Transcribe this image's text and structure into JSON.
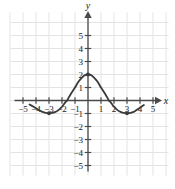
{
  "chart_data": {
    "type": "line",
    "title": "",
    "xlabel": "x",
    "ylabel": "y",
    "xlim": [
      -5.8,
      5.8
    ],
    "ylim": [
      -5.8,
      5.8
    ],
    "grid": true,
    "legend": null,
    "x_ticks": [
      -5,
      -4,
      -3,
      -2,
      -1,
      1,
      2,
      3,
      4,
      5
    ],
    "y_ticks": [
      -5,
      -4,
      -3,
      -2,
      -1,
      1,
      2,
      3,
      4,
      5
    ],
    "x_tick_labels": [
      "-5",
      "-4",
      "-3",
      "-2",
      "-1",
      "1",
      "2",
      "3",
      "4",
      "5"
    ],
    "y_tick_labels": [
      "-5",
      "-4",
      "-3",
      "-2",
      "-1",
      "1",
      "2",
      "3",
      "4",
      "5"
    ],
    "series": [
      {
        "name": "curve",
        "color": "#3a3a3a",
        "points": [
          [
            -4.5,
            -0.3
          ],
          [
            -4.25,
            -0.45
          ],
          [
            -4.0,
            -0.6
          ],
          [
            -3.75,
            -0.75
          ],
          [
            -3.5,
            -0.88
          ],
          [
            -3.25,
            -0.95
          ],
          [
            -3.0,
            -0.98
          ],
          [
            -2.75,
            -0.95
          ],
          [
            -2.5,
            -0.88
          ],
          [
            -2.25,
            -0.72
          ],
          [
            -2.0,
            -0.48
          ],
          [
            -1.75,
            -0.15
          ],
          [
            -1.6,
            0.0
          ],
          [
            -1.5,
            0.2
          ],
          [
            -1.25,
            0.62
          ],
          [
            -1.0,
            1.0
          ],
          [
            -0.75,
            1.42
          ],
          [
            -0.5,
            1.72
          ],
          [
            -0.25,
            1.94
          ],
          [
            0.0,
            2.0
          ],
          [
            0.25,
            1.94
          ],
          [
            0.5,
            1.72
          ],
          [
            0.75,
            1.42
          ],
          [
            1.0,
            1.0
          ],
          [
            1.25,
            0.62
          ],
          [
            1.5,
            0.2
          ],
          [
            1.6,
            0.0
          ],
          [
            1.75,
            -0.15
          ],
          [
            2.0,
            -0.48
          ],
          [
            2.25,
            -0.72
          ],
          [
            2.5,
            -0.88
          ],
          [
            2.75,
            -0.95
          ],
          [
            3.0,
            -0.98
          ],
          [
            3.25,
            -0.95
          ],
          [
            3.5,
            -0.88
          ],
          [
            3.75,
            -0.72
          ],
          [
            4.0,
            -0.55
          ],
          [
            4.3,
            -0.35
          ]
        ],
        "markers": [
          [
            -3.0,
            -0.98
          ],
          [
            0.0,
            2.0
          ],
          [
            3.0,
            -0.98
          ]
        ]
      }
    ],
    "colors": {
      "curve": "#3a3a3a",
      "axis": "#4a4a4a",
      "grid": "#e3e3e6",
      "text": "#1a1a1a",
      "background": "#ffffff"
    }
  }
}
